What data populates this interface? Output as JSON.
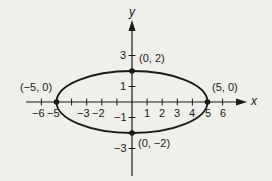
{
  "figure": {
    "type": "ellipse-graph",
    "equation_shape": "ellipse centered at origin",
    "colors": {
      "background": "#efefeb",
      "ink": "#1a1a1a"
    }
  },
  "axes": {
    "x_label": "x",
    "y_label": "y",
    "x_ticks": [
      "−6",
      "−5",
      "−3",
      "−2",
      "1",
      "2",
      "3",
      "4",
      "5",
      "6"
    ],
    "y_ticks": [
      "3",
      "1",
      "−1",
      "−3"
    ]
  },
  "points": [
    {
      "label": "(0, 2)",
      "x": 0,
      "y": 2
    },
    {
      "label": "(0, −2)",
      "x": 0,
      "y": -2
    },
    {
      "label": "(−5, 0)",
      "x": -5,
      "y": 0
    },
    {
      "label": "(5, 0)",
      "x": 5,
      "y": 0
    }
  ],
  "ellipse": {
    "cx": 0,
    "cy": 0,
    "a": 5,
    "b": 2
  }
}
